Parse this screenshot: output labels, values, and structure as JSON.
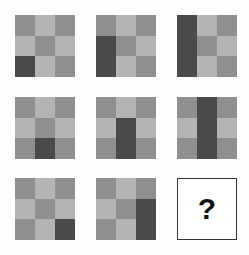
{
  "puzzle": {
    "colors": {
      "L": "#b4b4b4",
      "M": "#8f8f8f",
      "D": "#4a4a4a"
    },
    "tiles": [
      {
        "row": 0,
        "col": 0,
        "cells": [
          "M",
          "L",
          "M",
          "L",
          "M",
          "L",
          "D",
          "L",
          "M"
        ]
      },
      {
        "row": 0,
        "col": 1,
        "cells": [
          "M",
          "L",
          "M",
          "D",
          "M",
          "L",
          "D",
          "L",
          "M"
        ]
      },
      {
        "row": 0,
        "col": 2,
        "cells": [
          "D",
          "L",
          "M",
          "D",
          "M",
          "L",
          "D",
          "L",
          "M"
        ]
      },
      {
        "row": 1,
        "col": 0,
        "cells": [
          "M",
          "L",
          "M",
          "L",
          "M",
          "L",
          "M",
          "D",
          "M"
        ]
      },
      {
        "row": 1,
        "col": 1,
        "cells": [
          "M",
          "L",
          "M",
          "L",
          "D",
          "L",
          "M",
          "D",
          "M"
        ]
      },
      {
        "row": 1,
        "col": 2,
        "cells": [
          "M",
          "D",
          "M",
          "L",
          "D",
          "L",
          "M",
          "D",
          "M"
        ]
      },
      {
        "row": 2,
        "col": 0,
        "cells": [
          "M",
          "L",
          "M",
          "L",
          "M",
          "L",
          "M",
          "L",
          "D"
        ]
      },
      {
        "row": 2,
        "col": 1,
        "cells": [
          "M",
          "L",
          "M",
          "L",
          "M",
          "D",
          "M",
          "L",
          "D"
        ]
      }
    ],
    "answer_placeholder": "?"
  }
}
